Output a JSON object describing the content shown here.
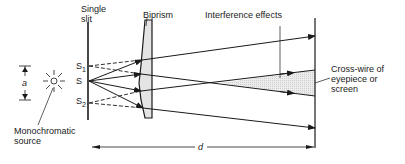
{
  "diagram": {
    "labels": {
      "single_slit": [
        "Single",
        "slit"
      ],
      "biprism": "Biprism",
      "interference": "Interference effects",
      "screen": [
        "Cross-wire of",
        "eyepiece or",
        "screen"
      ],
      "source": [
        "Monochromatic",
        "source"
      ],
      "s1": "S",
      "s1_sub": "1",
      "s": "S",
      "s2": "S",
      "s2_sub": "2",
      "a": "a",
      "d": "d"
    },
    "colors": {
      "ink": "#1a1a1a",
      "prism_fill": "#e4e4e4",
      "interference_fill": "#e8e8e8"
    }
  }
}
